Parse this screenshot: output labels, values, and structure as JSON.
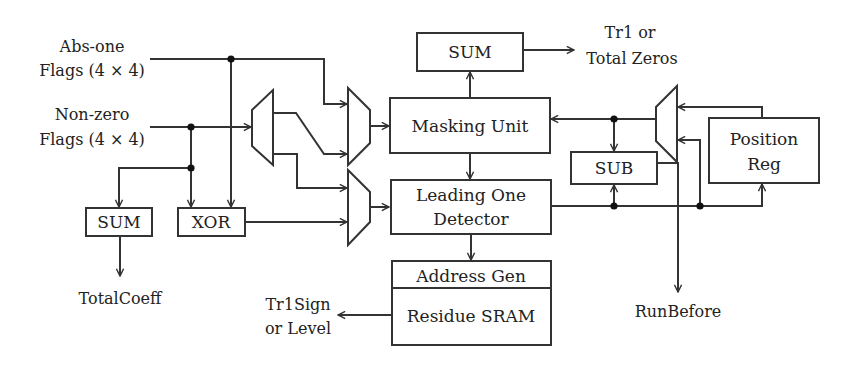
{
  "diagram": {
    "type": "hardware block diagram",
    "inputs": {
      "abs_one": {
        "line1": "Abs-one",
        "line2": "Flags (4 × 4)"
      },
      "non_zero": {
        "line1": "Non-zero",
        "line2": "Flags (4 × 4)"
      }
    },
    "blocks": {
      "sum_top": "SUM",
      "masking_unit": "Masking Unit",
      "leading_one_line1": "Leading One",
      "leading_one_line2": "Detector",
      "address_gen": "Address Gen",
      "residue_sram": "Residue SRAM",
      "sum_bottom": "SUM",
      "xor": "XOR",
      "sub": "SUB",
      "position_reg_line1": "Position",
      "position_reg_line2": "Reg"
    },
    "outputs": {
      "tr1_total_zeros": {
        "line1": "Tr1 or",
        "line2": "Total Zeros"
      },
      "total_coeff": "TotalCoeff",
      "tr1sign_level": {
        "line1": "Tr1Sign",
        "line2": "or Level"
      },
      "run_before": "RunBefore"
    },
    "colors": {
      "line": "#333333",
      "background": "#ffffff"
    }
  }
}
